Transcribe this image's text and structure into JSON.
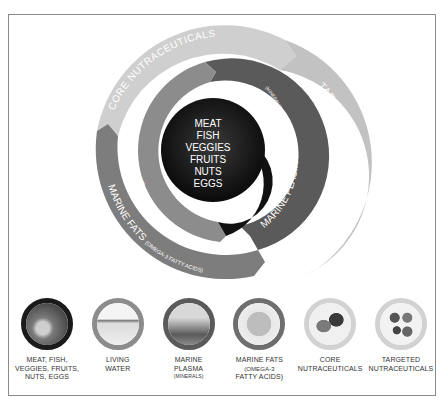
{
  "diagram": {
    "center": {
      "lines": [
        "MEAT",
        "FISH",
        "VEGGIES",
        "FRUITS",
        "NUTS",
        "EGGS"
      ],
      "color": "#111111"
    },
    "segments": [
      {
        "id": "living-water",
        "label": "LIVING WATER",
        "sublabel": "",
        "color": "#8c8c8c"
      },
      {
        "id": "marine-plasma",
        "label": "MARINE PLASMA",
        "sublabel": "(MINERALS)",
        "color": "#5a5a5a"
      },
      {
        "id": "marine-fats",
        "label": "MARINE FATS",
        "sublabel": "(OMEGA-3 FATTY ACIDS)",
        "color": "#7d7d7d"
      },
      {
        "id": "core-nutraceuticals",
        "label": "CORE NUTRACEUTICALS",
        "sublabel": "",
        "color": "#cfcfcf"
      },
      {
        "id": "targeted-nutraceuticals",
        "label": "TARGETED NUTRACEUTICALS",
        "sublabel": "",
        "color": "#c2c2c2"
      }
    ]
  },
  "legend": [
    {
      "line1": "MEAT, FISH,",
      "line2": "VEGGIES, FRUITS,",
      "line3": "NUTS, EGGS",
      "sub": "",
      "ring": "#1a1a1a",
      "photo": "#8f8f8f"
    },
    {
      "line1": "LIVING",
      "line2": "WATER",
      "line3": "",
      "sub": "",
      "ring": "#8c8c8c",
      "photo": "#e6e6e6"
    },
    {
      "line1": "MARINE",
      "line2": "PLASMA",
      "line3": "",
      "sub": "(MINERALS)",
      "ring": "#5a5a5a",
      "photo": "#a5a5a5"
    },
    {
      "line1": "MARINE FATS",
      "line2": "(OMEGA-3",
      "line3": "FATTY ACIDS)",
      "sub": "",
      "ring": "#6e6e6e",
      "photo": "#c8c8c8"
    },
    {
      "line1": "CORE",
      "line2": "NUTRACEUTICALS",
      "line3": "",
      "sub": "",
      "ring": "#cfcfcf",
      "photo": "#9a9a9a"
    },
    {
      "line1": "TARGETED",
      "line2": "NUTRACEUTICALS",
      "line3": "",
      "sub": "",
      "ring": "#cfcfcf",
      "photo": "#b5b5b5"
    }
  ]
}
